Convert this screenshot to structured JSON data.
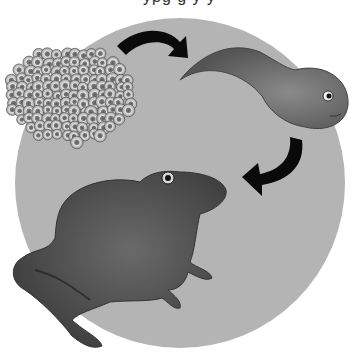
{
  "illustration": {
    "subject": "Frog life cycle",
    "stages": [
      {
        "name": "frogspawn",
        "label": "Eggs"
      },
      {
        "name": "tadpole",
        "label": "Tadpole"
      },
      {
        "name": "frog",
        "label": "Adult frog"
      }
    ],
    "arrows": [
      "eggs-to-tadpole",
      "tadpole-to-frog"
    ],
    "top_text_clipped": "ypg g y y"
  },
  "colors": {
    "background": "#ffffff",
    "circle": "#b4b4b4",
    "arrow": "#0a0a0a",
    "egg_fill": "#dcdcdc",
    "egg_core": "#6a6a6a",
    "tadpole": "#6e6e6e",
    "frog": "#4a4a4a"
  }
}
